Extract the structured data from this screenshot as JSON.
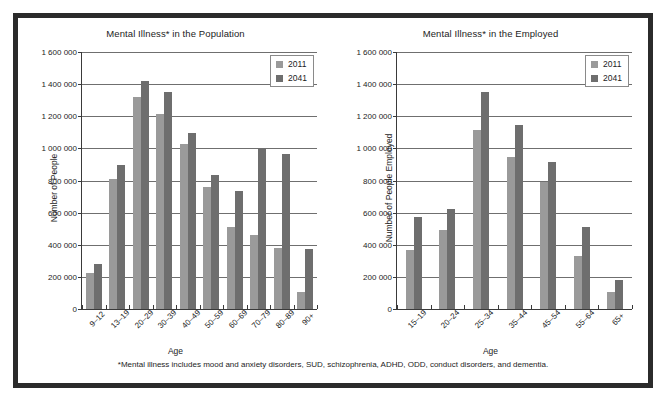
{
  "figure": {
    "footnote": "*Mental illness includes mood and anxiety disorders, SUD, schizophrenia, ADHD, ODD, conduct disorders, and dementia.",
    "border_color": "#2b2b2b",
    "background": "#ffffff"
  },
  "colors": {
    "series_2011": "#9a9a9a",
    "series_2041": "#6e6e6e",
    "axis": "#3a3a3a",
    "grid": "#6f6f6f"
  },
  "legend": {
    "items": [
      {
        "label": "2011",
        "color": "#9a9a9a"
      },
      {
        "label": "2041",
        "color": "#6e6e6e"
      }
    ]
  },
  "chart_data": [
    {
      "type": "bar",
      "title": "Mental Illness* in the Population",
      "xlabel": "Age",
      "ylabel": "Number of People",
      "ylim": [
        0,
        1600000
      ],
      "ytick_step": 200000,
      "ytick_labels": [
        "0",
        "200 000",
        "400 000",
        "600 000",
        "800 000",
        "1 000 000",
        "1 200 000",
        "1 400 000",
        "1 600 000"
      ],
      "grid": true,
      "legend_position": "top-right",
      "categories": [
        "9–12",
        "13–19",
        "20–29",
        "30–39",
        "40–49",
        "50–59",
        "60–69",
        "70–79",
        "80–89",
        "90+"
      ],
      "series": [
        {
          "name": "2011",
          "values": [
            225000,
            810000,
            1320000,
            1212000,
            1030000,
            760000,
            508000,
            462000,
            381000,
            107000
          ]
        },
        {
          "name": "2041",
          "values": [
            282000,
            897000,
            1420000,
            1350000,
            1095000,
            835000,
            733000,
            997000,
            968000,
            372000
          ]
        }
      ]
    },
    {
      "type": "bar",
      "title": "Mental Illness* in the Employed",
      "xlabel": "Age",
      "ylabel": "Number of People Employed",
      "ylim": [
        0,
        1600000
      ],
      "ytick_step": 200000,
      "ytick_labels": [
        "0",
        "200 000",
        "400 000",
        "600 000",
        "800 000",
        "1 000 000",
        "1 200 000",
        "1 400 000",
        "1 600 000"
      ],
      "grid": true,
      "legend_position": "top-right",
      "categories": [
        "15–19",
        "20–24",
        "25–34",
        "35–44",
        "45–54",
        "55–64",
        "65+"
      ],
      "series": [
        {
          "name": "2011",
          "values": [
            365000,
            490000,
            1115000,
            945000,
            790000,
            333000,
            103000
          ]
        },
        {
          "name": "2041",
          "values": [
            570000,
            622000,
            1350000,
            1145000,
            915000,
            512000,
            178000
          ]
        }
      ]
    }
  ]
}
